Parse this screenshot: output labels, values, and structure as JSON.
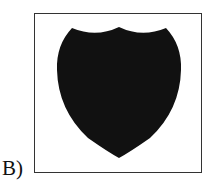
{
  "option_label": "B)",
  "figure": {
    "shape": "shield-icon",
    "fill_color": "#111111",
    "frame_color": "#333333"
  }
}
